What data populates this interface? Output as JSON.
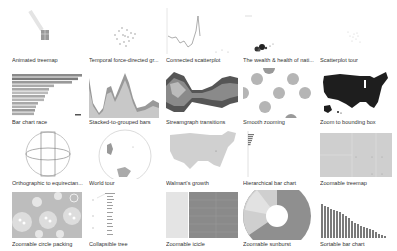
{
  "gallery": {
    "items": [
      {
        "label": "Animated treemap",
        "thumb": "animated-treemap"
      },
      {
        "label": "Temporal force-directed gr...",
        "thumb": "force-directed"
      },
      {
        "label": "Connected scatterplot",
        "thumb": "connected-scatterplot"
      },
      {
        "label": "The wealth & health of nati...",
        "thumb": "wealth-health"
      },
      {
        "label": "Scatterplot tour",
        "thumb": "scatterplot-tour"
      },
      {
        "label": "Bar chart race",
        "thumb": "bar-chart-race"
      },
      {
        "label": "Stacked-to-grouped bars",
        "thumb": "stacked-grouped"
      },
      {
        "label": "Streamgraph transitions",
        "thumb": "streamgraph"
      },
      {
        "label": "Smooth zooming",
        "thumb": "smooth-zooming"
      },
      {
        "label": "Zoom to bounding box",
        "thumb": "us-map-dark"
      },
      {
        "label": "Orthographic to equirectan...",
        "thumb": "orthographic"
      },
      {
        "label": "World tour",
        "thumb": "world-tour"
      },
      {
        "label": "Walmart's growth",
        "thumb": "us-map-light"
      },
      {
        "label": "Hierarchical bar chart",
        "thumb": "hier-bar"
      },
      {
        "label": "Zoomable treemap",
        "thumb": "zoomable-treemap"
      },
      {
        "label": "Zoomable circle packing",
        "thumb": "circle-packing"
      },
      {
        "label": "Collapsible tree",
        "thumb": "collapsible-tree"
      },
      {
        "label": "Zoomable icicle",
        "thumb": "icicle"
      },
      {
        "label": "Zoomable sunburst",
        "thumb": "sunburst"
      },
      {
        "label": "Sortable bar chart",
        "thumb": "sortable-bar"
      }
    ]
  },
  "colors": {
    "label_text": "#333333",
    "thumb_gray": "#9a9a9a",
    "map_dark": "#1e1e1e",
    "map_light": "#d0d0d0",
    "treemap_fill": "#cfcfcf"
  }
}
